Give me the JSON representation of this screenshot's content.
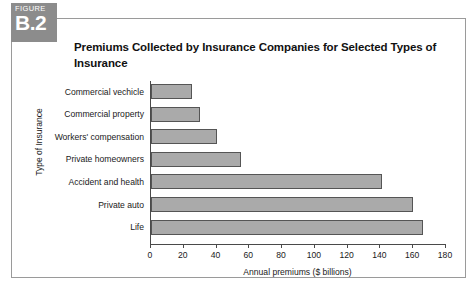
{
  "figure": {
    "label_word": "FIGURE",
    "number": "B.2",
    "title": "Premiums Collected by Insurance Companies for Selected Types of Insurance"
  },
  "chart_data": {
    "type": "bar",
    "orientation": "horizontal",
    "title": "Premiums Collected by Insurance Companies for Selected Types of Insurance",
    "xlabel": "Annual premiums ($ billions)",
    "ylabel": "Type of Insurance",
    "xlim": [
      0,
      180
    ],
    "xticks": [
      "0",
      "20",
      "40",
      "60",
      "80",
      "100",
      "120",
      "140",
      "160",
      "180"
    ],
    "grid": false,
    "legend": null,
    "bar_color": "#aaaaaa",
    "bar_edge_color": "#555555",
    "categories": [
      "Commercial vechicle",
      "Commercial property",
      "Workers' compensation",
      "Private homeowners",
      "Accident and health",
      "Private auto",
      "Life"
    ],
    "values": [
      25,
      30,
      40,
      55,
      141,
      160,
      166
    ]
  }
}
